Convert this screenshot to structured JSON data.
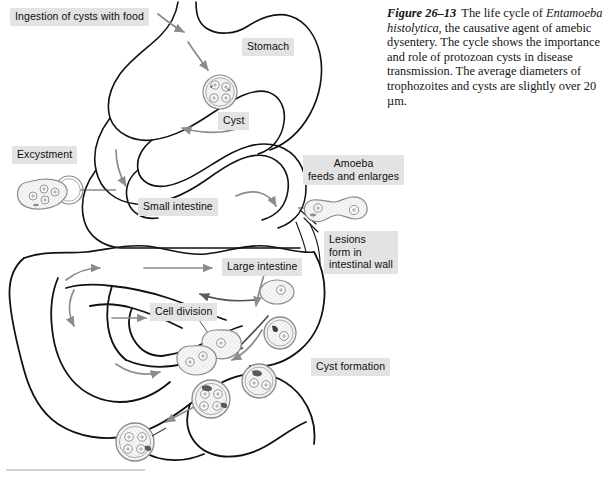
{
  "figure": {
    "number": "Figure 26–13",
    "caption_text": " The life cycle of ",
    "species": "Entamoeba histolytica,",
    "caption_rest": " the causative agent of amebic dysentery. The cycle shows the importance and role of protozoan cysts in disease transmission. The average diameters of trophozoites and cysts are slightly over 20 µm.",
    "full_caption": "Figure 26–13  The life cycle of Entamoeba histolytica, the causative agent of amebic dysentery. The cycle shows the importance and role of protozoan cysts in disease transmission. The average diameters of trophozoites and cysts are slightly over 20 µm."
  },
  "labels": {
    "ingestion": "Ingestion of cysts with food",
    "stomach": "Stomach",
    "cyst": "Cyst",
    "excystment": "Excystment",
    "small_intestine": "Small intestine",
    "amoeba_feeds": "Amoeba\nfeeds and enlarges",
    "lesions": "Lesions\nform in\nintestinal wall",
    "large_intestine": "Large intestine",
    "cell_division": "Cell division",
    "cyst_formation": "Cyst formation"
  },
  "colors": {
    "label_background": "#e3e3e3",
    "label_text": "#0d0d0d",
    "organ_outline": "#111111",
    "flow_arrow": "#8c8c8c",
    "cell_outline": "#8a8a8a",
    "cell_fill": "#f4f4f4",
    "page_background": "#ffffff",
    "rule": "#d2d2d2"
  },
  "diagram": {
    "organs": [
      "esophagus",
      "stomach",
      "small-intestine",
      "large-intestine"
    ],
    "stages": [
      {
        "name": "ingested-cyst",
        "nuclei": 4,
        "location": "stomach"
      },
      {
        "name": "excysting-amoeba",
        "nuclei": 4,
        "location": "small-intestine"
      },
      {
        "name": "trophozoite-pair",
        "nuclei": 2,
        "location": "small-intestine-wall"
      },
      {
        "name": "dividing-trophozoite-upper",
        "nuclei": 1,
        "location": "large-intestine"
      },
      {
        "name": "dividing-trophozoite-lower",
        "nuclei": 2,
        "location": "large-intestine"
      },
      {
        "name": "precyst",
        "nuclei": 1,
        "location": "large-intestine"
      },
      {
        "name": "immature-cyst-1n",
        "nuclei": 1,
        "location": "large-intestine"
      },
      {
        "name": "immature-cyst-2n",
        "nuclei": 2,
        "location": "large-intestine"
      },
      {
        "name": "mature-cyst-4n-a",
        "nuclei": 4,
        "location": "rectum"
      },
      {
        "name": "mature-cyst-4n-b",
        "nuclei": 4,
        "location": "excreted"
      }
    ]
  }
}
